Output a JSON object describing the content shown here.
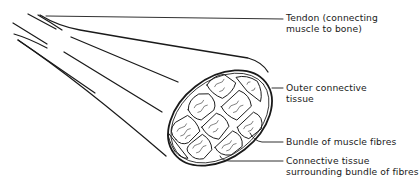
{
  "diagram": {
    "labels": [
      {
        "id": "tendon",
        "lines": [
          "Tendon (connecting",
          "muscle to bone)"
        ]
      },
      {
        "id": "outer-connective-tissue",
        "lines": [
          "Outer connective",
          "tissue"
        ]
      },
      {
        "id": "bundle-of-muscle-fibres",
        "lines": [
          "Bundle of muscle fibres"
        ]
      },
      {
        "id": "connective-tissue-bundle",
        "lines": [
          "Connective tissue",
          "surrounding bundle of fibres"
        ]
      }
    ],
    "colors": {
      "ink": "#1a1a1a",
      "background": "#ffffff"
    }
  }
}
